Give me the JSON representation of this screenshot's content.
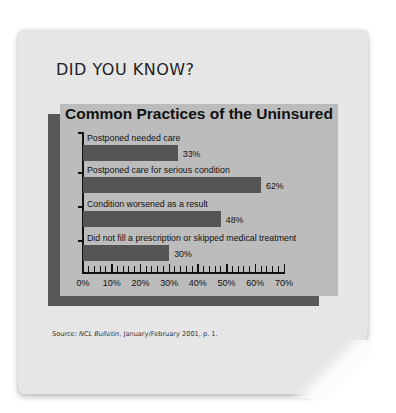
{
  "card": {
    "headline": "DID YOU KNOW?",
    "source_prefix": "Source: ",
    "source_title": "NCL Bulletin",
    "source_suffix": ", January/February 2001, p. 1."
  },
  "colors": {
    "card_bg": "#e6e6e6",
    "chart_face": "#bcbcbc",
    "chart_shadow": "#585858",
    "bar": "#555555",
    "text": "#111111"
  },
  "chart_data": {
    "type": "bar",
    "orientation": "horizontal",
    "title": "Common Practices of the Uninsured",
    "categories": [
      "Postponed needed care",
      "Postponed care for serious condition",
      "Condition worsened as a result",
      "Did not fill a prescription or skipped medical treatment"
    ],
    "values": [
      33,
      62,
      48,
      30
    ],
    "value_labels": [
      "33%",
      "62%",
      "48%",
      "30%"
    ],
    "xlabel": "",
    "ylabel": "",
    "xlim": [
      0,
      70
    ],
    "x_ticks": [
      "0%",
      "10%",
      "20%",
      "30%",
      "40%",
      "50%",
      "60%",
      "70%"
    ],
    "minor_tick_step": 2,
    "grid": false,
    "legend": null,
    "source": "Source: NCL Bulletin, January/February 2001, p. 1."
  }
}
